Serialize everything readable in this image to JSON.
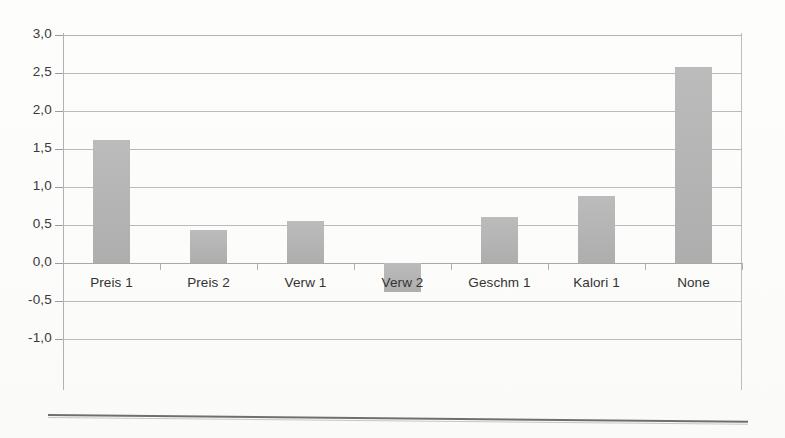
{
  "chart_data": {
    "type": "bar",
    "title": "",
    "subtitle": "",
    "xlabel": "",
    "ylabel": "",
    "categories": [
      "Preis 1",
      "Preis 2",
      "Verw 1",
      "Verw 2",
      "Geschm 1",
      "Kalori 1",
      "None"
    ],
    "values": [
      1.62,
      0.44,
      0.55,
      -0.38,
      0.6,
      0.88,
      2.58
    ],
    "ylim": [
      -1.0,
      3.0
    ],
    "ytick_values": [
      3.0,
      2.5,
      2.0,
      1.5,
      1.0,
      0.5,
      0.0,
      -0.5,
      -1.0
    ],
    "ytick_labels": [
      "3,0",
      "2,5",
      "2,0",
      "1,5",
      "1,0",
      "0,5",
      "0,0",
      "-0,5",
      "-1,0"
    ],
    "grid": true,
    "legend": "none",
    "decimal_separator": ",",
    "bar_color": "#b4b4b4",
    "gridline_color": "#b9bbbb",
    "axis_color": "#b0b2b2",
    "label_color": "#333333",
    "background_color": "#fdfdfc"
  }
}
